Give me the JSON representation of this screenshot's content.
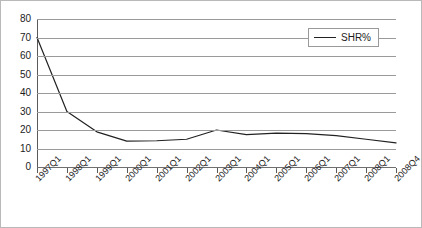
{
  "chart_data": {
    "type": "line",
    "title": "",
    "subtitle": "",
    "xlabel": "",
    "ylabel": "",
    "ylim": [
      0,
      80
    ],
    "y_ticks": [
      0,
      10,
      20,
      30,
      40,
      50,
      60,
      70,
      80
    ],
    "grid": true,
    "legend_position": "top-right",
    "categories": [
      "1997Q1",
      "1998Q1",
      "1999Q1",
      "2000Q1",
      "2001Q1",
      "2002Q1",
      "2003Q1",
      "2004Q1",
      "2005Q1",
      "2006Q1",
      "2007Q1",
      "2008Q1",
      "2008Q4"
    ],
    "series": [
      {
        "name": "SHR%",
        "color": "#222222",
        "values": [
          70,
          30,
          19,
          14,
          14.2,
          15,
          20,
          17.5,
          18.3,
          18,
          17,
          15,
          13
        ]
      }
    ]
  },
  "legend": {
    "entries": [
      {
        "label": "SHR%"
      }
    ]
  }
}
